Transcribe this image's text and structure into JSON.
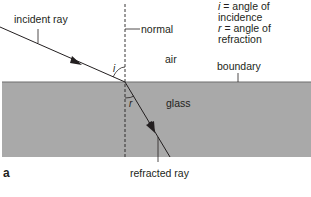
{
  "diagram": {
    "figure_label": "a",
    "legend": [
      {
        "symbol": "i",
        "text": "= angle of incidence"
      },
      {
        "symbol": "r",
        "text": "= angle of refraction"
      }
    ],
    "labels": {
      "incident_ray": "incident ray",
      "normal": "normal",
      "air": "air",
      "boundary": "boundary",
      "glass": "glass",
      "refracted_ray": "refracted ray",
      "angle_i": "i",
      "angle_r": "r"
    },
    "colors": {
      "glass_fill": "#a9a9a9",
      "boundary_line": "#6e6e6e",
      "ray": "#231f20",
      "text": "#231f20"
    }
  }
}
